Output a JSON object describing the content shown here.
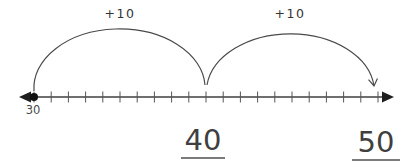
{
  "figure": {
    "start_point_label": "30"
  },
  "chart_data": {
    "type": "number-line",
    "axis_min": 30,
    "axis_max": 50,
    "tick_step": 1,
    "start_point": 30,
    "start_point_label": "30",
    "jumps": [
      {
        "label": "+10",
        "from": 30,
        "to": 40
      },
      {
        "label": "+10",
        "from": 40,
        "to": 50
      }
    ],
    "answers": [
      "40",
      "50"
    ],
    "line_color": "#3f3f3f",
    "arc_color": "#4a4a4a",
    "underline_color": "#7b7b7b"
  }
}
